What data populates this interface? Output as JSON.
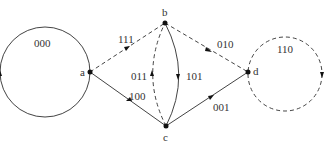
{
  "diagram": {
    "type": "state-transition-graph",
    "nodes": [
      {
        "id": "a",
        "label": "a",
        "x": 90,
        "y": 72
      },
      {
        "id": "b",
        "label": "b",
        "x": 165,
        "y": 23
      },
      {
        "id": "c",
        "label": "c",
        "x": 166,
        "y": 126
      },
      {
        "id": "d",
        "label": "d",
        "x": 248,
        "y": 72
      }
    ],
    "edges": [
      {
        "from": "a",
        "to": "a",
        "label": "000",
        "style": "solid",
        "kind": "loop"
      },
      {
        "from": "a",
        "to": "b",
        "label": "111",
        "style": "dashed"
      },
      {
        "from": "b",
        "to": "d",
        "label": "010",
        "style": "dashed"
      },
      {
        "from": "c",
        "to": "a",
        "label": "100",
        "style": "solid"
      },
      {
        "from": "c",
        "to": "b",
        "label": "011",
        "style": "dashed",
        "kind": "curve"
      },
      {
        "from": "b",
        "to": "c",
        "label": "101",
        "style": "solid",
        "kind": "curve"
      },
      {
        "from": "c",
        "to": "d",
        "label": "001",
        "style": "solid"
      },
      {
        "from": "d",
        "to": "d",
        "label": "110",
        "style": "dashed",
        "kind": "loop"
      }
    ],
    "colors": {
      "line": "#444444",
      "node": "#111111",
      "text": "#333333",
      "background": "#ffffff"
    }
  }
}
